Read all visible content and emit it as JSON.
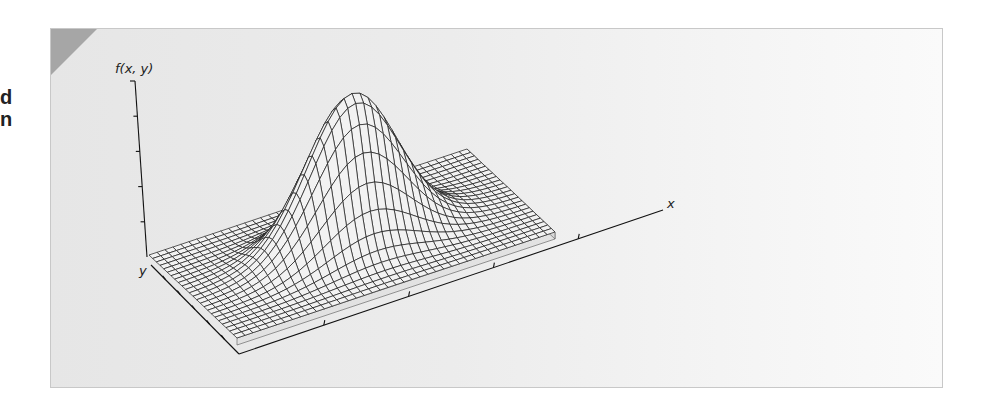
{
  "page": {
    "edge_fragments": [
      "d",
      "n"
    ]
  },
  "colors": {
    "panel_corner": "#a6a6a6",
    "mesh": "#1a1a1a",
    "surface_fill": "#f2f2f2",
    "base_side": "#e2e2e2"
  },
  "chart_data": {
    "type": "surface",
    "title": "",
    "function": "f(x, y) = exp(-((x - 0.5)^2 + (y - 0.5)^2) / (2 * 0.14^2))",
    "xlabel": "x",
    "ylabel": "y",
    "zlabel": "f(x, y)",
    "x_range": [
      0,
      1
    ],
    "y_range": [
      0,
      1
    ],
    "z_range": [
      0,
      1
    ],
    "grid_lines_x": 40,
    "grid_lines_y": 24,
    "peak": {
      "x": 0.5,
      "y": 0.5,
      "z": 1.0
    },
    "x_ticks": 4,
    "y_ticks": 5,
    "z_ticks": 4,
    "legend": "none"
  }
}
